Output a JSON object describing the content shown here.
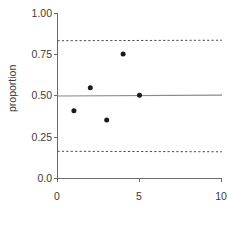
{
  "chart_data": {
    "type": "scatter",
    "title": "",
    "xlabel": "",
    "ylabel": "proportion",
    "xlim": [
      0,
      10
    ],
    "ylim": [
      0.0,
      1.0
    ],
    "xticks": [
      0,
      5,
      10
    ],
    "xtick_labels": [
      "0",
      "5",
      "10"
    ],
    "yticks": [
      0.0,
      0.25,
      0.5,
      0.75,
      1.0
    ],
    "ytick_labels": [
      "0.0",
      "0.25",
      "0.50",
      "0.75",
      "1.00"
    ],
    "grid": false,
    "legend": null,
    "x": [
      1,
      2,
      3,
      4,
      5
    ],
    "values": [
      0.41,
      0.55,
      0.355,
      0.755,
      0.505
    ],
    "points": [
      {
        "x": 1,
        "y": 0.41
      },
      {
        "x": 2,
        "y": 0.55
      },
      {
        "x": 3,
        "y": 0.355
      },
      {
        "x": 4,
        "y": 0.755
      },
      {
        "x": 5,
        "y": 0.505
      }
    ],
    "reference_lines": [
      {
        "name": "center-line",
        "style": "solid",
        "y_start": 0.5,
        "y_end": 0.505,
        "color": "#8a8a8a"
      },
      {
        "name": "upper-control-limit",
        "style": "dashed",
        "y_start": 0.835,
        "y_end": 0.838,
        "color": "#4a4a4a"
      },
      {
        "name": "lower-control-limit",
        "style": "dashed",
        "y_start": 0.165,
        "y_end": 0.162,
        "color": "#4a4a4a"
      }
    ]
  },
  "axis": {
    "y_title": "proportion",
    "y_labels": {
      "t100": "1.00",
      "t075": "0.75",
      "t050": "0.50",
      "t025": "0.25",
      "t000": "0.0"
    },
    "x_labels": {
      "t0": "0",
      "t5": "5",
      "t10": "10"
    }
  }
}
